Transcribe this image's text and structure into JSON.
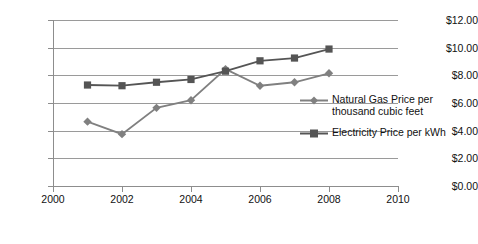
{
  "chart_data": {
    "type": "line",
    "title": "",
    "subtitle": "",
    "xlabel": "",
    "ylabel": "",
    "xlim": [
      2000,
      2010
    ],
    "ylim": [
      0,
      12
    ],
    "xticks": [
      2000,
      2002,
      2004,
      2006,
      2008,
      2010
    ],
    "yticks": [
      0,
      2,
      4,
      6,
      8,
      10,
      12
    ],
    "xtick_labels": [
      "2000",
      "2002",
      "2004",
      "2006",
      "2008",
      "2010"
    ],
    "ytick_labels": [
      "$0.00",
      "$2.00",
      "$4.00",
      "$6.00",
      "$8.00",
      "$10.00",
      "$12.00"
    ],
    "grid": true,
    "grid_axis": "y",
    "legend_position": "right",
    "series": [
      {
        "name": "Natural Gas Price per thousand cubic feet",
        "marker": "diamond",
        "color": "#808080",
        "x": [
          2001,
          2002,
          2003,
          2004,
          2005,
          2006,
          2007,
          2008
        ],
        "values": [
          4.65,
          3.75,
          5.65,
          6.2,
          8.45,
          7.25,
          7.5,
          8.15
        ]
      },
      {
        "name": "Electricity Price per kWh",
        "marker": "square",
        "color": "#555555",
        "x": [
          2001,
          2002,
          2003,
          2004,
          2005,
          2006,
          2007,
          2008
        ],
        "values": [
          7.3,
          7.25,
          7.5,
          7.7,
          8.3,
          9.05,
          9.25,
          9.9
        ]
      }
    ]
  },
  "legend": {
    "items": [
      {
        "label": "Natural Gas Price per thousand cubic feet",
        "marker": "diamond-marker-icon"
      },
      {
        "label": "Electricity Price per kWh",
        "marker": "square-marker-icon"
      }
    ]
  }
}
